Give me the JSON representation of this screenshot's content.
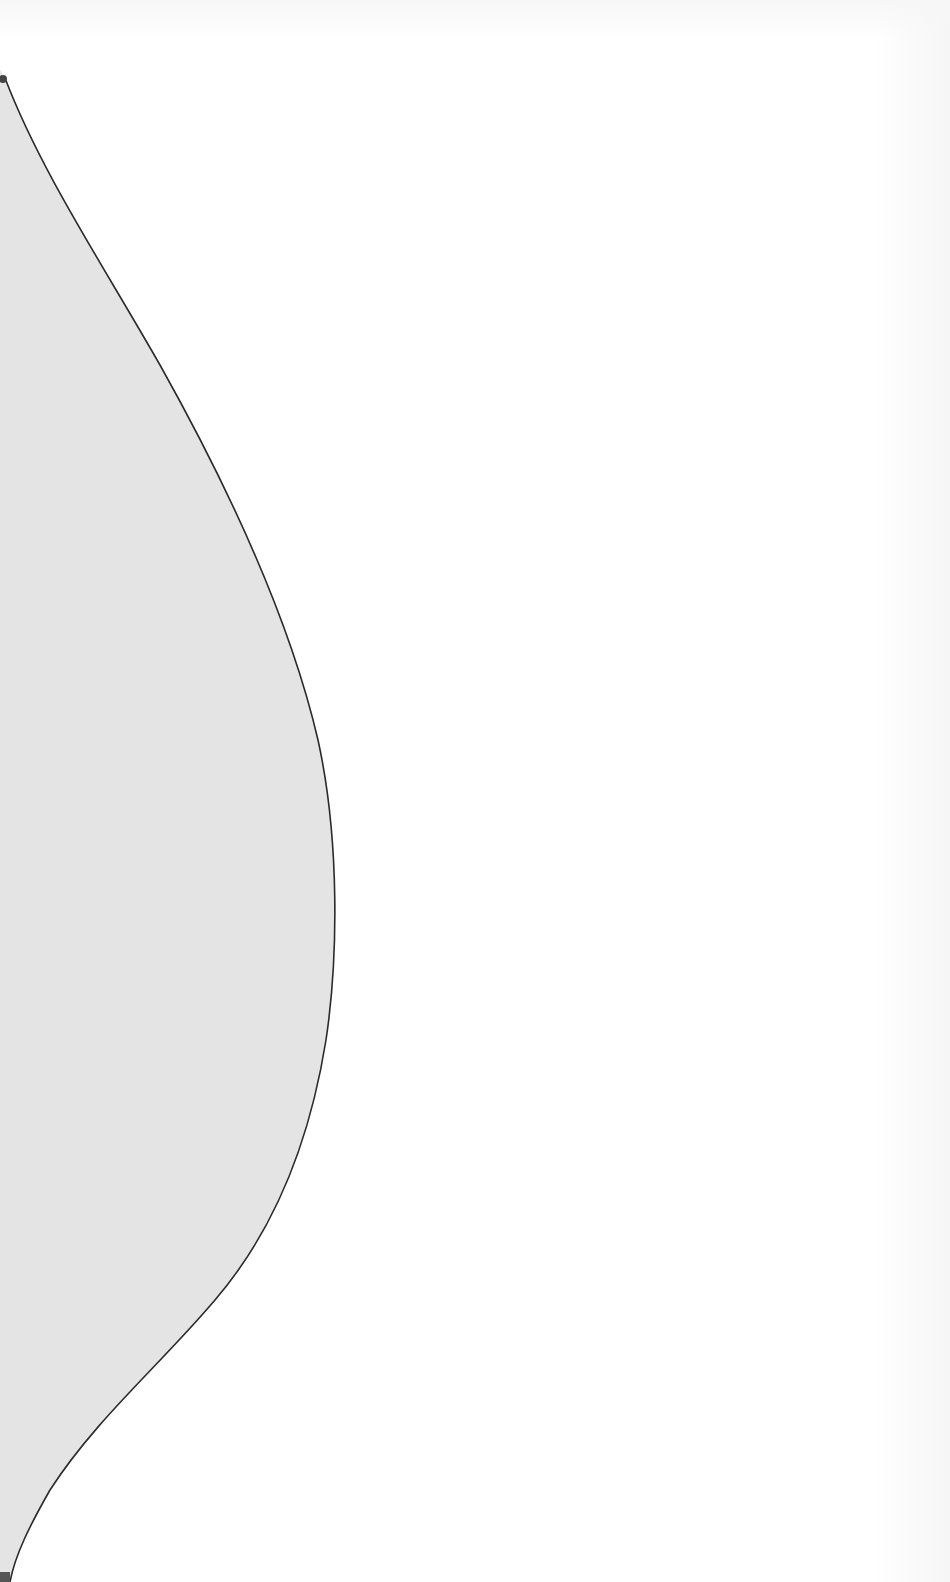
{
  "scene": {
    "description": "Gray curved silhouette shape bounded by a thin dark outline on a white background",
    "colors": {
      "background": "#ffffff",
      "shape_fill": "#e4e4e4",
      "outline": "#2a2a2a",
      "corner_mark": "#555555"
    },
    "outline_points": [
      [
        5,
        78
      ],
      [
        30,
        140
      ],
      [
        62,
        200
      ],
      [
        125,
        300
      ],
      [
        180,
        400
      ],
      [
        238,
        500
      ],
      [
        280,
        600
      ],
      [
        314,
        700
      ],
      [
        328,
        800
      ],
      [
        335,
        900
      ],
      [
        333,
        960
      ],
      [
        330,
        1000
      ],
      [
        310,
        1100
      ],
      [
        277,
        1200
      ],
      [
        250,
        1250
      ],
      [
        215,
        1300
      ],
      [
        170,
        1350
      ],
      [
        130,
        1400
      ],
      [
        80,
        1450
      ],
      [
        40,
        1510
      ],
      [
        10,
        1575
      ]
    ]
  }
}
